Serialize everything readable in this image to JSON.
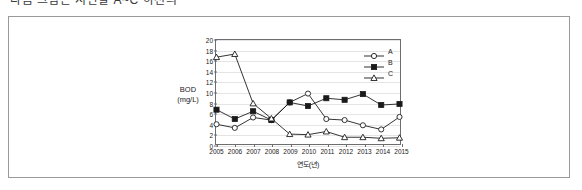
{
  "caption": {
    "text": "다음 그림은 지난날 A~C 하천의"
  },
  "figure": {
    "border_color": "#9a9a9a"
  },
  "chart_data": {
    "type": "line",
    "title": "",
    "xlabel": "연도(년)",
    "ylabel": "BOD\n(mg/L)",
    "ylabel_line1": "BOD",
    "ylabel_line2": "(mg/L)",
    "grid": true,
    "legend_position": "top-right",
    "xlim": [
      2005,
      2015
    ],
    "ylim": [
      0,
      20
    ],
    "ytick_step": 2,
    "categories": [
      "2005",
      "2006",
      "2007",
      "2008",
      "2009",
      "2010",
      "2011",
      "2012",
      "2013",
      "2014",
      "2015"
    ],
    "yticks": [
      "0",
      "2",
      "4",
      "6",
      "8",
      "10",
      "12",
      "14",
      "16",
      "18",
      "20"
    ],
    "series": [
      {
        "name": "A",
        "marker": "open-circle",
        "color": "#1a1a1a",
        "values": [
          3.8,
          3.1,
          5.1,
          4.6,
          8.0,
          9.7,
          4.8,
          4.6,
          3.6,
          2.8,
          5.2
        ]
      },
      {
        "name": "B",
        "marker": "filled-square",
        "color": "#1a1a1a",
        "values": [
          6.6,
          4.8,
          6.3,
          4.6,
          8.0,
          7.3,
          8.8,
          8.5,
          9.6,
          7.5,
          7.7
        ]
      },
      {
        "name": "C",
        "marker": "open-triangle",
        "color": "#1a1a1a",
        "values": [
          16.7,
          17.3,
          7.8,
          4.9,
          1.9,
          1.8,
          2.4,
          1.3,
          1.3,
          1.1,
          1.2
        ]
      }
    ]
  }
}
